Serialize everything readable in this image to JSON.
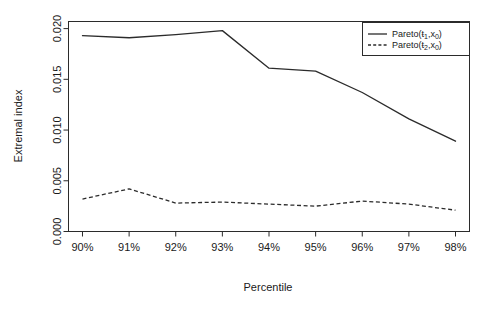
{
  "chart_data": {
    "type": "line",
    "title": "",
    "xlabel": "Percentile",
    "ylabel": "Extremal index",
    "categories": [
      "90%",
      "91%",
      "92%",
      "93%",
      "94%",
      "95%",
      "96%",
      "97%",
      "98%"
    ],
    "x": [
      90,
      91,
      92,
      93,
      94,
      95,
      96,
      97,
      98
    ],
    "xlim": [
      89.7,
      98.3
    ],
    "ylim": [
      0.0,
      0.0207
    ],
    "grid": false,
    "legend_position": "top-right",
    "series": [
      {
        "name": "Pareto(ŧ₁,x₀)",
        "style": "solid",
        "color": "#2b2b2b",
        "values": [
          0.0193,
          0.0191,
          0.0194,
          0.0198,
          0.0161,
          0.0158,
          0.0137,
          0.0111,
          0.0089
        ]
      },
      {
        "name": "Pareto(ŧ₂,x₀)",
        "style": "dashed",
        "color": "#2b2b2b",
        "values": [
          0.0032,
          0.0042,
          0.0028,
          0.0029,
          0.0027,
          0.0025,
          0.003,
          0.0027,
          0.0021
        ]
      }
    ],
    "y_ticks": [
      {
        "value": 0.0,
        "label": "0.000"
      },
      {
        "value": 0.005,
        "label": "0.005"
      },
      {
        "value": 0.01,
        "label": "0.010"
      },
      {
        "value": 0.015,
        "label": "0.015"
      },
      {
        "value": 0.02,
        "label": "0.020"
      }
    ],
    "x_ticks": [
      {
        "value": 90,
        "label": "90%"
      },
      {
        "value": 91,
        "label": "91%"
      },
      {
        "value": 92,
        "label": "92%"
      },
      {
        "value": 93,
        "label": "93%"
      },
      {
        "value": 94,
        "label": "94%"
      },
      {
        "value": 95,
        "label": "95%"
      },
      {
        "value": 96,
        "label": "96%"
      },
      {
        "value": 97,
        "label": "97%"
      },
      {
        "value": 98,
        "label": "98%"
      }
    ]
  },
  "legend": {
    "entries": [
      {
        "label_base": "Pareto(",
        "label_sym": "ŧ",
        "label_sub": "1",
        "label_tail": ",x",
        "label_sub2": "0",
        "label_close": ")"
      },
      {
        "label_base": "Pareto(",
        "label_sym": "ŧ",
        "label_sub": "2",
        "label_tail": ",x",
        "label_sub2": "0",
        "label_close": ")"
      }
    ]
  },
  "axes": {
    "x_title": "Percentile",
    "y_title": "Extremal index"
  }
}
